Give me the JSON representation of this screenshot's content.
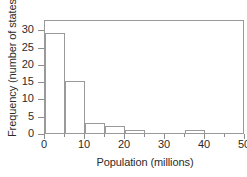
{
  "chart_data": {
    "type": "bar",
    "title": "",
    "subtitle": "",
    "xlabel": "Population (millions)",
    "ylabel": "Frequency (number of states)",
    "xlim": [
      0,
      50
    ],
    "ylim": [
      0,
      33
    ],
    "grid": false,
    "legend": null,
    "bin_width": 5,
    "bin_edges": [
      0,
      5,
      10,
      15,
      20,
      25,
      30,
      35,
      40,
      45,
      50
    ],
    "categories": [
      "0-5",
      "5-10",
      "10-15",
      "15-20",
      "20-25",
      "25-30",
      "30-35",
      "35-40",
      "40-45",
      "45-50"
    ],
    "values": [
      29,
      15,
      3,
      2,
      1,
      0,
      0,
      1,
      0,
      0
    ],
    "bars": [
      {
        "label": "0-5",
        "start": 0,
        "end": 5,
        "value": 29
      },
      {
        "label": "5-10",
        "start": 5,
        "end": 10,
        "value": 15
      },
      {
        "label": "10-15",
        "start": 10,
        "end": 15,
        "value": 3
      },
      {
        "label": "15-20",
        "start": 15,
        "end": 20,
        "value": 2
      },
      {
        "label": "20-25",
        "start": 20,
        "end": 25,
        "value": 1
      },
      {
        "label": "35-40",
        "start": 35,
        "end": 40,
        "value": 1
      }
    ],
    "x_ticks": [
      {
        "value": 0,
        "label": "0",
        "major": true
      },
      {
        "value": 5,
        "label": "",
        "major": false
      },
      {
        "value": 10,
        "label": "10",
        "major": true
      },
      {
        "value": 15,
        "label": "",
        "major": false
      },
      {
        "value": 20,
        "label": "20",
        "major": true
      },
      {
        "value": 25,
        "label": "",
        "major": false
      },
      {
        "value": 30,
        "label": "30",
        "major": true
      },
      {
        "value": 35,
        "label": "",
        "major": false
      },
      {
        "value": 40,
        "label": "40",
        "major": true
      },
      {
        "value": 45,
        "label": "",
        "major": false
      },
      {
        "value": 50,
        "label": "50",
        "major": true
      }
    ],
    "y_ticks": [
      {
        "value": 0,
        "label": "0"
      },
      {
        "value": 5,
        "label": "5"
      },
      {
        "value": 10,
        "label": "10"
      },
      {
        "value": 15,
        "label": "15"
      },
      {
        "value": 20,
        "label": "20"
      },
      {
        "value": 25,
        "label": "25"
      },
      {
        "value": 30,
        "label": "30"
      }
    ],
    "colors": {
      "bar_edge": "#9a9a9a",
      "bar_fill": "transparent",
      "axis": "#999999",
      "text": "#2b2b2b",
      "background": "#ffffff"
    }
  }
}
